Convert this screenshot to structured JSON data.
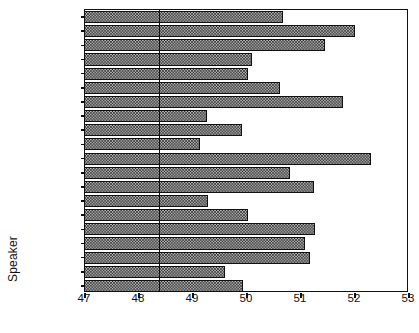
{
  "chart_data": {
    "type": "bar",
    "orientation": "horizontal",
    "title": "",
    "xlabel": "",
    "ylabel": "Speaker",
    "xlim": [
      47,
      53
    ],
    "xticks": [
      47,
      48,
      49,
      50,
      51,
      52,
      53
    ],
    "xtick_labels": [
      "47",
      "48",
      "49",
      "50",
      "51",
      "52",
      "53"
    ],
    "grid": false,
    "legend": null,
    "reference_line": 48.37,
    "bar_base": 47,
    "categories": [
      "Truman",
      "Dewey",
      "Eisenhower",
      "Stevenson",
      "Kennedy",
      "Nixon",
      "Johnson",
      "Goldwater",
      "Humphrey",
      "McGovern",
      "Ford",
      "Carter",
      "Reagan",
      "Anderson",
      "Mondale",
      "Bush",
      "Dukakis",
      "Clinton",
      "Perot",
      "Dole"
    ],
    "values": [
      50.67,
      52.0,
      51.44,
      50.09,
      50.02,
      50.61,
      51.78,
      49.26,
      49.9,
      49.13,
      52.3,
      50.8,
      51.24,
      49.28,
      50.02,
      51.26,
      51.07,
      51.17,
      49.59,
      49.93
    ],
    "series": [
      {
        "name": "Grade level",
        "values": [
          50.67,
          52.0,
          51.44,
          50.09,
          50.02,
          50.61,
          51.78,
          49.26,
          49.9,
          49.13,
          52.3,
          50.8,
          51.24,
          49.28,
          50.02,
          51.26,
          51.07,
          51.17,
          49.59,
          49.93
        ]
      }
    ]
  },
  "colors": {
    "axis": "#111111",
    "bar_fill": "#b7b7b7",
    "bar_edge": "#111111",
    "background": "#ffffff"
  }
}
